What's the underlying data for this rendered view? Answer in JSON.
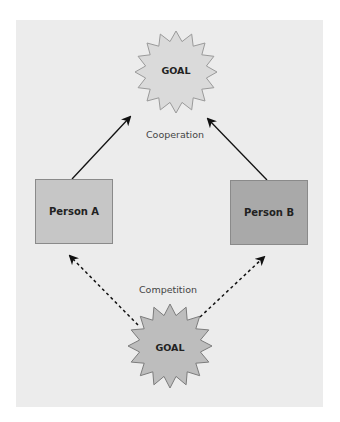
{
  "diagram": {
    "top_goal": {
      "label": "GOAL"
    },
    "bottom_goal": {
      "label": "GOAL"
    },
    "cooperation_label": "Cooperation",
    "competition_label": "Competition",
    "person_a": {
      "label": "Person A",
      "color": "#c6c6c6"
    },
    "person_b": {
      "label": "Person B",
      "color": "#a9a9a9"
    },
    "colors": {
      "panel": "#ececec",
      "top_star": "#dadada",
      "bottom_star": "#bdbdbd",
      "arrow": "#111111"
    }
  }
}
